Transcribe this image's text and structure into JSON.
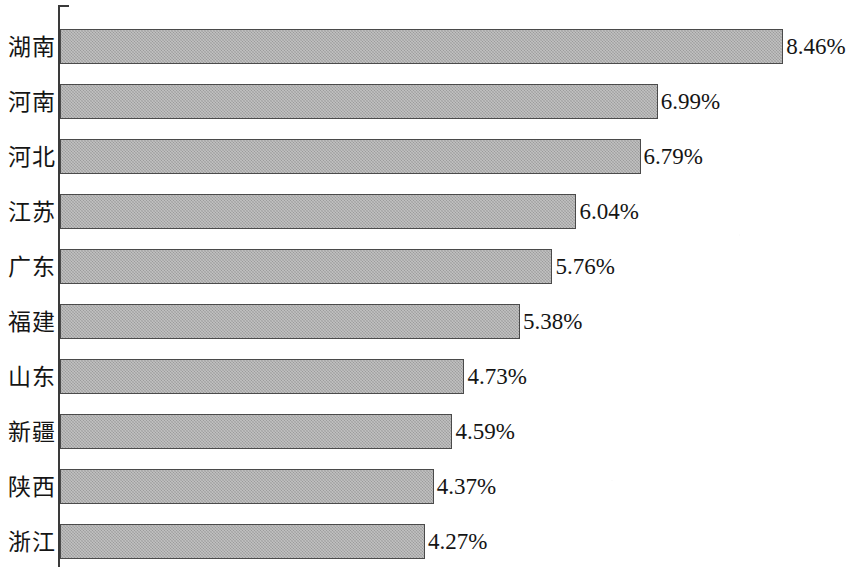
{
  "chart_data": {
    "type": "bar",
    "orientation": "horizontal",
    "title": "",
    "subtitle": "",
    "xlabel": "",
    "ylabel": "",
    "categories": [
      "湖南",
      "河南",
      "河北",
      "江苏",
      "广东",
      "福建",
      "山东",
      "新疆",
      "陕西",
      "浙江"
    ],
    "values": [
      8.46,
      6.99,
      6.79,
      6.04,
      5.76,
      5.38,
      4.73,
      4.59,
      4.37,
      4.27
    ],
    "value_labels": [
      "8.46%",
      "6.99%",
      "6.79%",
      "6.04%",
      "5.76%",
      "5.38%",
      "4.73%",
      "4.59%",
      "4.37%",
      "4.27%"
    ],
    "unit": "%",
    "xlim": [
      0,
      9.2
    ],
    "ylim": null,
    "grid": false,
    "legend": null,
    "legend_position": "none",
    "tick_labels_x": [],
    "annotations": [],
    "sorted": "descending",
    "series": [
      {
        "name": "",
        "values": [
          8.46,
          6.99,
          6.79,
          6.04,
          5.76,
          5.38,
          4.73,
          4.59,
          4.37,
          4.27
        ]
      }
    ]
  },
  "style": {
    "bar_fill": "#a9a9a9",
    "bar_border": "#4a4a4a",
    "axis_color": "#3a3a3a",
    "text_color": "#151515",
    "background": "#ffffff"
  },
  "axis": {
    "tick_count": 11
  }
}
